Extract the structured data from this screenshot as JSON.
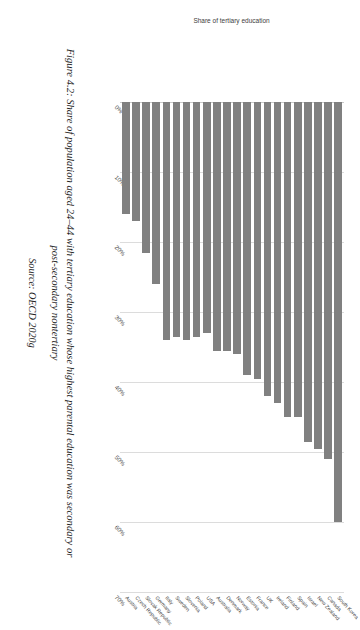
{
  "figure": {
    "caption": "Figure 4.2: Share of population aged 24–44 with tertiary education whose highest parental education was secondary or post-secondary nontertiary",
    "source": "Source: OECD 2020g"
  },
  "chart_data": {
    "type": "bar",
    "orientation": "vertical",
    "title": "",
    "xlabel": "",
    "ylabel": "Share of tertiary education",
    "ylim": [
      0,
      70
    ],
    "ytick_labels": [
      "0%",
      "10%",
      "20%",
      "30%",
      "40%",
      "50%",
      "60%",
      "70%"
    ],
    "ytick_values": [
      0,
      10,
      20,
      30,
      40,
      50,
      60,
      70
    ],
    "grid": true,
    "legend": false,
    "bar_color": "#808080",
    "categories": [
      "South Korea",
      "Canada",
      "New Zealand",
      "Israel",
      "Spain",
      "Finland",
      "Ireland",
      "UK",
      "France",
      "Estonia",
      "Norway",
      "Denmark",
      "Australia",
      "USA",
      "Poland",
      "Slovenia",
      "Sweden",
      "Italy",
      "Germany",
      "Slovak Republic",
      "Czech Republic",
      "Austria"
    ],
    "values": [
      60,
      51,
      49.5,
      48.5,
      45,
      45,
      43,
      42,
      39.5,
      39,
      36,
      35.5,
      35.5,
      33,
      33.5,
      34,
      33.5,
      34,
      26,
      21.5,
      17,
      16
    ]
  },
  "axis": {
    "title": "Share of tertiary education"
  }
}
